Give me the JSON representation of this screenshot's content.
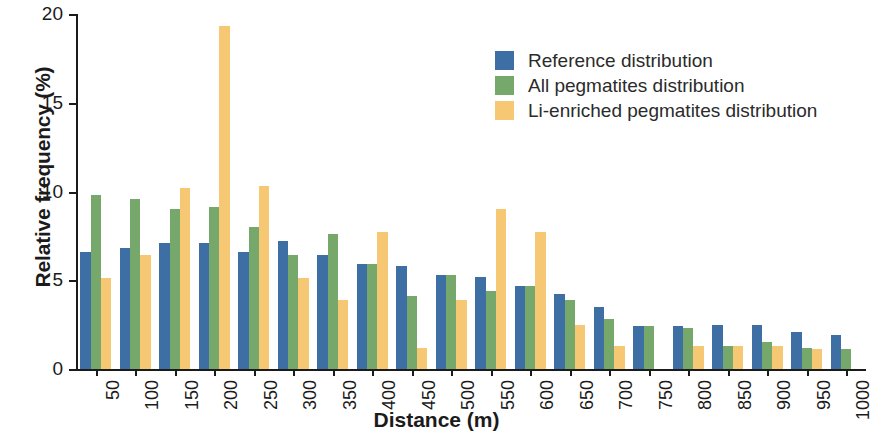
{
  "chart_data": {
    "type": "bar",
    "title": "",
    "xlabel": "Distance (m)",
    "ylabel": "Relative frequency (%)",
    "ylim": [
      0,
      20
    ],
    "yticks": [
      0,
      5,
      10,
      15,
      20
    ],
    "ytick_labels": [
      "0",
      "5",
      "10",
      "15",
      "20"
    ],
    "grid": false,
    "legend_position": "upper right",
    "categories": [
      "50",
      "100",
      "150",
      "200",
      "250",
      "300",
      "350",
      "400",
      "450",
      "500",
      "550",
      "600",
      "650",
      "700",
      "750",
      "800",
      "850",
      "900",
      "950",
      "1000"
    ],
    "series": [
      {
        "name": "Reference distribution",
        "color": "#3d6fa5",
        "values": [
          6.6,
          6.8,
          7.1,
          7.1,
          6.6,
          7.2,
          6.4,
          5.9,
          5.8,
          5.3,
          5.2,
          4.7,
          4.2,
          3.5,
          2.4,
          2.4,
          2.5,
          2.5,
          2.1,
          1.9
        ]
      },
      {
        "name": "All pegmatites distribution",
        "color": "#76a86b",
        "values": [
          9.8,
          9.6,
          9.0,
          9.1,
          8.0,
          6.4,
          7.6,
          5.9,
          4.1,
          5.3,
          4.4,
          4.7,
          3.9,
          2.8,
          2.4,
          2.3,
          1.3,
          1.5,
          1.2,
          1.1
        ]
      },
      {
        "name": "Li-enriched pegmatites distribution",
        "color": "#f7c873",
        "values": [
          5.1,
          6.4,
          10.2,
          19.3,
          10.3,
          5.1,
          3.9,
          7.7,
          1.2,
          3.9,
          9.0,
          7.7,
          2.5,
          1.3,
          0.0,
          1.3,
          1.3,
          1.3,
          1.1,
          0.0
        ]
      }
    ]
  },
  "legend": {
    "items": [
      {
        "label": "Reference distribution",
        "color": "#3d6fa5"
      },
      {
        "label": "All pegmatites distribution",
        "color": "#76a86b"
      },
      {
        "label": "Li-enriched pegmatites distribution",
        "color": "#f7c873"
      }
    ]
  }
}
